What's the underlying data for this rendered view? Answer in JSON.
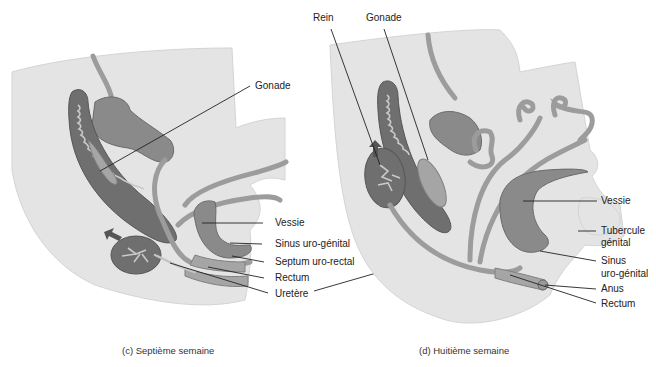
{
  "panels": [
    {
      "id": "c",
      "caption": "(c) Septième semaine",
      "labels": {
        "gonade": "Gonade",
        "vessie": "Vessie",
        "sinus": "Sinus uro-génital",
        "septum": "Septum uro-rectal",
        "rectum": "Rectum",
        "uretere": "Uretère"
      }
    },
    {
      "id": "d",
      "caption": "(d) Huitième semaine",
      "labels": {
        "rein": "Rein",
        "gonade": "Gonade",
        "vessie": "Vessie",
        "tubercule_1": "Tubercule",
        "tubercule_2": "génital",
        "sinus_1": "Sinus",
        "sinus_2": "uro-génital",
        "anus": "Anus",
        "rectum": "Rectum"
      }
    }
  ],
  "colors": {
    "tissue": "#e4e4e4",
    "organ": "#8a8a8a",
    "organ_dark": "#6f6f6f",
    "leader": "#222222"
  }
}
